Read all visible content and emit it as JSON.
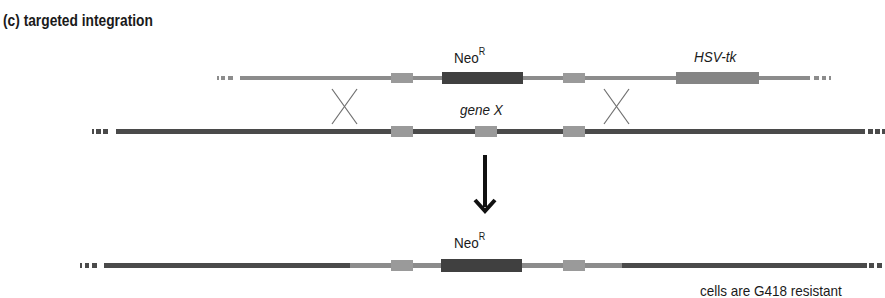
{
  "title": "(c)  targeted integration",
  "labels": {
    "neo_top": "Neo",
    "neo_top_sup": "R",
    "hsv_tk": "HSV-tk",
    "gene_x": "gene X",
    "neo_bottom": "Neo",
    "neo_bottom_sup": "R",
    "result": "cells are G418 resistant"
  },
  "colors": {
    "vector_line": "#8c8c8c",
    "homology_box": "#9a9a9a",
    "neo_box": "#404040",
    "hsv_box": "#858585",
    "genomic_line": "#4a4a4a",
    "crossover": "#6e6e6e",
    "arrow": "#111111"
  }
}
